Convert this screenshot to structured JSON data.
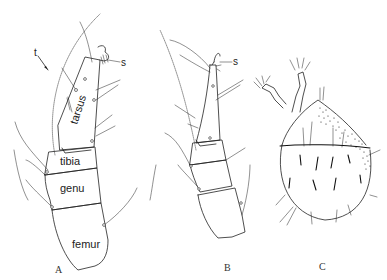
{
  "figure": {
    "panels": [
      {
        "id": "A",
        "label": "A",
        "segments": [
          "tarsus",
          "tibia",
          "genu",
          "femur"
        ],
        "pointers": [
          {
            "label": "t"
          },
          {
            "label": "s"
          }
        ]
      },
      {
        "id": "B",
        "label": "B",
        "pointers": [
          {
            "label": "s"
          }
        ]
      },
      {
        "id": "C",
        "label": "C"
      }
    ],
    "colors": {
      "ink": "#222222",
      "background": "#ffffff"
    }
  }
}
